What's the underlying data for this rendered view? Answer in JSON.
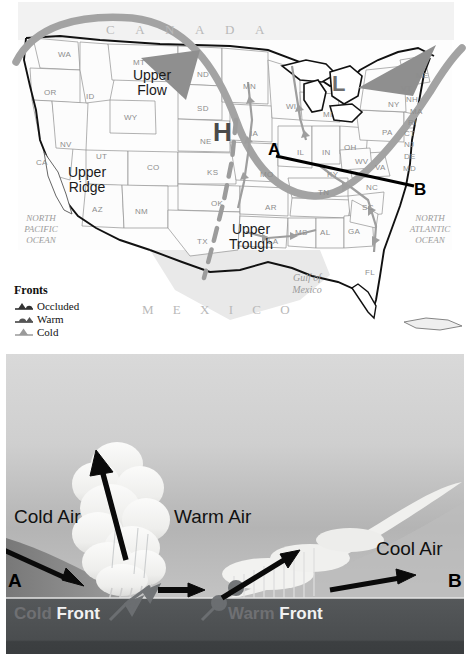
{
  "map": {
    "country_labels": {
      "canada": "C A N A D A",
      "mexico": "M E X I C O"
    },
    "ocean_labels": {
      "pacific_line1": "NORTH",
      "pacific_line2": "PACIFIC",
      "pacific_line3": "OCEAN",
      "atlantic_line1": "NORTH",
      "atlantic_line2": "ATLANTIC",
      "atlantic_line3": "OCEAN",
      "gulf_line1": "Gulf of",
      "gulf_line2": "Mexico"
    },
    "annotations": {
      "upper_flow_line1": "Upper",
      "upper_flow_line2": "Flow",
      "upper_ridge_line1": "Upper",
      "upper_ridge_line2": "Ridge",
      "upper_trough_line1": "Upper",
      "upper_trough_line2": "Trough",
      "high_pressure": "H",
      "low_pressure": "L",
      "point_a": "A",
      "point_b": "B"
    },
    "states": [
      {
        "abbr": "WA",
        "x": 58,
        "y": 50
      },
      {
        "abbr": "OR",
        "x": 44,
        "y": 88
      },
      {
        "abbr": "ID",
        "x": 86,
        "y": 92
      },
      {
        "abbr": "NV",
        "x": 60,
        "y": 140
      },
      {
        "abbr": "CA",
        "x": 36,
        "y": 158
      },
      {
        "abbr": "UT",
        "x": 96,
        "y": 152
      },
      {
        "abbr": "AZ",
        "x": 92,
        "y": 205
      },
      {
        "abbr": "NM",
        "x": 135,
        "y": 207
      },
      {
        "abbr": "CO",
        "x": 147,
        "y": 163
      },
      {
        "abbr": "WY",
        "x": 124,
        "y": 113
      },
      {
        "abbr": "MT",
        "x": 133,
        "y": 58
      },
      {
        "abbr": "ND",
        "x": 197,
        "y": 70
      },
      {
        "abbr": "SD",
        "x": 197,
        "y": 104
      },
      {
        "abbr": "NE",
        "x": 200,
        "y": 137
      },
      {
        "abbr": "KS",
        "x": 207,
        "y": 168
      },
      {
        "abbr": "OK",
        "x": 211,
        "y": 199
      },
      {
        "abbr": "TX",
        "x": 197,
        "y": 237
      },
      {
        "abbr": "MN",
        "x": 243,
        "y": 82
      },
      {
        "abbr": "IA",
        "x": 250,
        "y": 129
      },
      {
        "abbr": "MO",
        "x": 260,
        "y": 170
      },
      {
        "abbr": "AR",
        "x": 265,
        "y": 203
      },
      {
        "abbr": "LA",
        "x": 268,
        "y": 237
      },
      {
        "abbr": "WI",
        "x": 286,
        "y": 102
      },
      {
        "abbr": "IL",
        "x": 297,
        "y": 148
      },
      {
        "abbr": "IN",
        "x": 322,
        "y": 148
      },
      {
        "abbr": "MI",
        "x": 323,
        "y": 110
      },
      {
        "abbr": "OH",
        "x": 344,
        "y": 143
      },
      {
        "abbr": "KY",
        "x": 327,
        "y": 170
      },
      {
        "abbr": "TN",
        "x": 318,
        "y": 188
      },
      {
        "abbr": "MS",
        "x": 295,
        "y": 228
      },
      {
        "abbr": "AL",
        "x": 320,
        "y": 228
      },
      {
        "abbr": "GA",
        "x": 348,
        "y": 227
      },
      {
        "abbr": "FL",
        "x": 365,
        "y": 268
      },
      {
        "abbr": "SC",
        "x": 362,
        "y": 203
      },
      {
        "abbr": "NC",
        "x": 366,
        "y": 183
      },
      {
        "abbr": "VA",
        "x": 375,
        "y": 163
      },
      {
        "abbr": "WV",
        "x": 355,
        "y": 157
      },
      {
        "abbr": "PA",
        "x": 382,
        "y": 128
      },
      {
        "abbr": "NY",
        "x": 388,
        "y": 100
      },
      {
        "abbr": "MD",
        "x": 403,
        "y": 164
      },
      {
        "abbr": "DE",
        "x": 404,
        "y": 152
      },
      {
        "abbr": "NJ",
        "x": 404,
        "y": 140
      },
      {
        "abbr": "CT",
        "x": 404,
        "y": 129
      },
      {
        "abbr": "RI",
        "x": 408,
        "y": 118
      },
      {
        "abbr": "MA",
        "x": 410,
        "y": 107
      },
      {
        "abbr": "NH",
        "x": 406,
        "y": 95
      },
      {
        "abbr": "VT",
        "x": 401,
        "y": 84
      },
      {
        "abbr": "ME",
        "x": 416,
        "y": 71
      }
    ],
    "legend": {
      "title": "Fronts",
      "items": [
        {
          "label": "Occluded",
          "symbol": "occluded-front-symbol"
        },
        {
          "label": "Warm",
          "symbol": "warm-front-symbol"
        },
        {
          "label": "Cold",
          "symbol": "cold-front-symbol"
        }
      ]
    },
    "colors": {
      "jet_stream": "#a0a0a0",
      "trough_line": "#9a9a9a",
      "state_border": "#8f8f8f",
      "coastline": "#1a1a1a",
      "ab_line": "#000000",
      "state_fill": "#fbfbfb",
      "land_outside": "#e8e8e8"
    }
  },
  "cross_section": {
    "labels": {
      "cold_air": "Cold Air",
      "warm_air": "Warm Air",
      "cool_air": "Cool Air",
      "point_a": "A",
      "point_b": "B",
      "cold_front_word1": "Cold",
      "cold_front_word2": "Front",
      "warm_front_word1": "Warm",
      "warm_front_word2": "Front"
    },
    "colors": {
      "sky_top": "#d2d2d2",
      "sky_mid": "#bfbfbf",
      "cold_wedge": "#8a8a8a",
      "ground": "#4f5153",
      "ground_low": "#3f4143",
      "cloud": "#f4f4f2",
      "arrow": "#0a0a0a",
      "front_symbol": "#6d6f71"
    }
  }
}
